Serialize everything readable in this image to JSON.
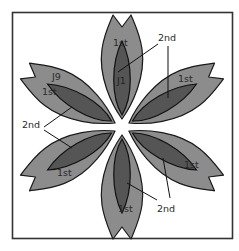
{
  "diagram": {
    "type": "six-petal flower appliqué piece diagram",
    "colors": {
      "outer_petal": "#8c8c8c",
      "inner_petal": "#555555",
      "outline": "#1a1a1a",
      "frame": "#333333"
    },
    "petals": [
      {
        "position": "top",
        "outer_label": "1st",
        "inner_label": "J1"
      },
      {
        "position": "upper-right",
        "outer_label": "1st"
      },
      {
        "position": "lower-right",
        "outer_label": "1st"
      },
      {
        "position": "bottom",
        "outer_label": "1st"
      },
      {
        "position": "lower-left",
        "outer_label": "1st"
      },
      {
        "position": "upper-left",
        "outer_label": "1st",
        "piece_label": "J9"
      }
    ],
    "callouts": [
      {
        "label": "2nd",
        "position": "top-right",
        "points_to": "top petal inner + upper-right petal inner"
      },
      {
        "label": "2nd",
        "position": "left",
        "points_to": "upper-left petal inner + lower-left petal inner"
      },
      {
        "label": "2nd",
        "position": "bottom-right",
        "points_to": "bottom petal inner + lower-right petal inner"
      }
    ]
  }
}
